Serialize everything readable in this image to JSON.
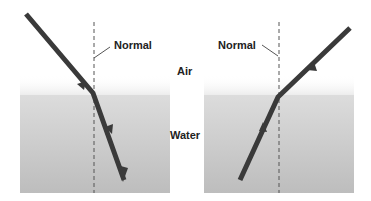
{
  "diagram": {
    "media": {
      "top_label": "Air",
      "bottom_label": "Water"
    },
    "panels": [
      {
        "name": "air-to-water",
        "normal_label": "Normal",
        "direction": "Light ray travels from air into water, bending toward the normal"
      },
      {
        "name": "water-to-air",
        "normal_label": "Normal",
        "direction": "Light ray travels from water into air, bending away from the normal"
      }
    ],
    "colors": {
      "water_top": "#e6e6e6",
      "water_bottom": "#b8b8b8",
      "ray": "#3a3a3a",
      "normal_line": "#555555"
    }
  }
}
